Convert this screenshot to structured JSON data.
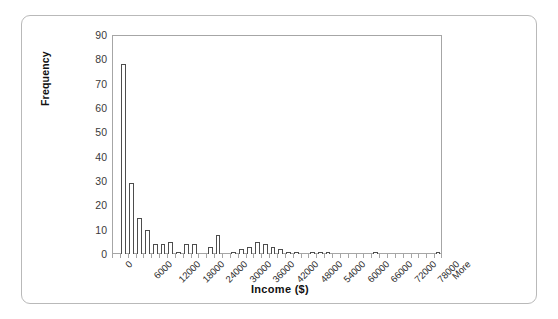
{
  "chart_data": {
    "type": "bar",
    "title": "",
    "subtitle": "",
    "xlabel": "Income ($)",
    "ylabel": "Frequency",
    "ylim": [
      0,
      90
    ],
    "ytick_step": 10,
    "yticks": [
      90,
      80,
      70,
      60,
      50,
      40,
      30,
      20,
      10,
      0
    ],
    "grid": false,
    "legend": null,
    "legend_position": "none",
    "bin_width": 2000,
    "tick_label_interval": 3,
    "xtick_labels": [
      "0",
      "6000",
      "12000",
      "18000",
      "24000",
      "30000",
      "36000",
      "42000",
      "48000",
      "54000",
      "60000",
      "66000",
      "72000",
      "78000",
      "More"
    ],
    "categories": [
      "0",
      "2000",
      "4000",
      "6000",
      "8000",
      "10000",
      "12000",
      "14000",
      "16000",
      "18000",
      "20000",
      "22000",
      "24000",
      "26000",
      "28000",
      "30000",
      "32000",
      "34000",
      "36000",
      "38000",
      "40000",
      "42000",
      "44000",
      "46000",
      "48000",
      "50000",
      "52000",
      "54000",
      "56000",
      "58000",
      "60000",
      "62000",
      "64000",
      "66000",
      "68000",
      "70000",
      "72000",
      "74000",
      "76000",
      "78000",
      "80000",
      "More"
    ],
    "values": [
      0,
      78,
      29,
      15,
      10,
      4,
      4,
      5,
      1,
      4,
      4,
      0,
      3,
      8,
      0,
      1,
      2,
      3,
      5,
      4,
      3,
      2,
      1,
      1,
      0,
      1,
      1,
      1,
      0,
      0,
      0,
      0,
      0,
      1,
      0,
      0,
      0,
      0,
      0,
      0,
      0,
      1
    ],
    "bar_fill_color": "#ffffff",
    "bar_edge_color": "#4d4d4d",
    "axis_color": "#a6a6a6",
    "text_color": "#2e2e2e",
    "frame_color": "#b9b9b9"
  }
}
